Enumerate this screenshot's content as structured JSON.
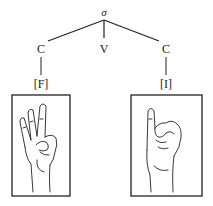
{
  "diagram": {
    "root": {
      "label": "σ"
    },
    "children": [
      {
        "label": "C",
        "feature": "[F]",
        "image": "handshape-f"
      },
      {
        "label": "V"
      },
      {
        "label": "C",
        "feature": "[I]",
        "image": "handshape-i"
      }
    ]
  }
}
